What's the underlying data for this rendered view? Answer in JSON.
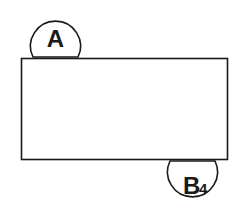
{
  "diagram": {
    "label_top": "A",
    "label_bottom_main": "B",
    "label_bottom_sub": "4",
    "stroke_color": "#1a1a1a",
    "background_color": "#ffffff"
  }
}
